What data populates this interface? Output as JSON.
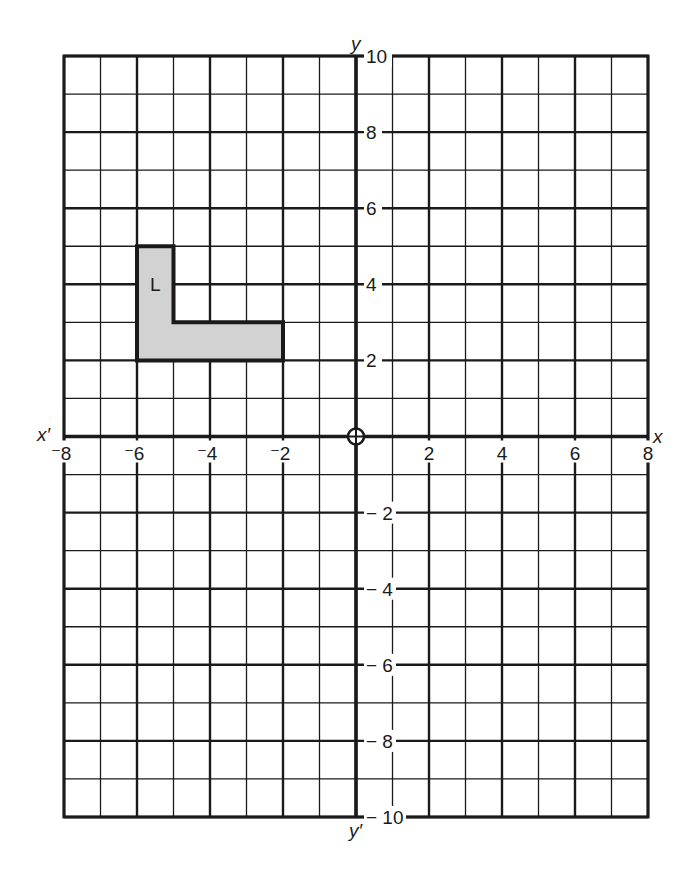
{
  "chart_data": {
    "type": "coordinate-grid",
    "title": "",
    "xlabel": "x",
    "xlabel_neg": "x′",
    "ylabel": "y",
    "ylabel_neg": "y′",
    "xlim": [
      -8,
      8
    ],
    "ylim": [
      -10,
      10
    ],
    "grid": true,
    "grid_minor_step": 1,
    "grid_major_step": 2,
    "x_ticks": [
      {
        "value": -8,
        "label": "⁻8"
      },
      {
        "value": -6,
        "label": "⁻6"
      },
      {
        "value": -4,
        "label": "⁻4"
      },
      {
        "value": -2,
        "label": "⁻2"
      },
      {
        "value": 2,
        "label": "2"
      },
      {
        "value": 4,
        "label": "4"
      },
      {
        "value": 6,
        "label": "6"
      },
      {
        "value": 8,
        "label": "8"
      }
    ],
    "y_ticks": [
      {
        "value": 10,
        "label": "10"
      },
      {
        "value": 8,
        "label": "8"
      },
      {
        "value": 6,
        "label": "6"
      },
      {
        "value": 4,
        "label": "4"
      },
      {
        "value": 2,
        "label": "2"
      },
      {
        "value": -2,
        "label": "− 2"
      },
      {
        "value": -4,
        "label": "− 4"
      },
      {
        "value": -6,
        "label": "− 6"
      },
      {
        "value": -8,
        "label": "− 8"
      },
      {
        "value": -10,
        "label": "− 10"
      }
    ],
    "origin_marker": "circle-cross",
    "shapes": [
      {
        "name": "L",
        "label": "L",
        "label_position": [
          -5.5,
          4
        ],
        "fill": "#d2d2d2",
        "stroke": "#1a1a1a",
        "vertices": [
          [
            -6,
            2
          ],
          [
            -6,
            5
          ],
          [
            -5,
            5
          ],
          [
            -5,
            3
          ],
          [
            -2,
            3
          ],
          [
            -2,
            2
          ]
        ]
      }
    ]
  },
  "colors": {
    "grid": "#1a1a1a",
    "background": "#ffffff",
    "shape_fill": "#d2d2d2"
  }
}
